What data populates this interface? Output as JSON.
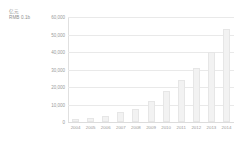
{
  "unit_caption": {
    "line1": "亿元",
    "line2": "RMB 0.1b"
  },
  "chart_data": {
    "type": "bar",
    "title": "",
    "subtitle": "",
    "xlabel": "",
    "ylabel": "亿元 / RMB 0.1b",
    "categories": [
      "2004",
      "2005",
      "2006",
      "2007",
      "2008",
      "2009",
      "2010",
      "2011",
      "2012",
      "2013",
      "2014"
    ],
    "values": [
      1500,
      2500,
      3500,
      5500,
      7500,
      12000,
      18000,
      24000,
      31000,
      40000,
      53000
    ],
    "series": [
      {
        "name": "",
        "values": [
          1500,
          2500,
          3500,
          5500,
          7500,
          12000,
          18000,
          24000,
          31000,
          40000,
          53000
        ]
      }
    ],
    "ylim": [
      0,
      60000
    ],
    "ytick_labels": [
      "60,000",
      "50,000",
      "40,000",
      "30,000",
      "20,000",
      "10,000",
      "0"
    ],
    "ytick_values": [
      60000,
      50000,
      40000,
      30000,
      20000,
      10000,
      0
    ],
    "grid": true,
    "legend": "none",
    "bar_color": "#f2f2f2",
    "grid_color": "#e9e9e9",
    "text_color": "#9a9a9a"
  }
}
